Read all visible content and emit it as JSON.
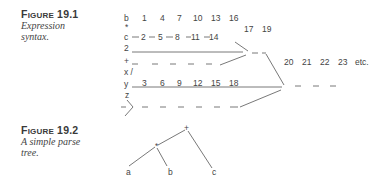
{
  "figures": [
    {
      "label_prefix": "F",
      "label_rest": "IGURE",
      "number": "19.1",
      "caption_line1": "Expression",
      "caption_line2": "syntax."
    },
    {
      "label_prefix": "F",
      "label_rest": "IGURE",
      "number": "19.2",
      "caption_line1": "A simple parse",
      "caption_line2": "tree."
    }
  ],
  "syntax_diagram": {
    "row_b": {
      "var": "b",
      "nums": [
        "1",
        "4",
        "7",
        "10",
        "13",
        "16"
      ]
    },
    "row_star": "*",
    "row_c": {
      "var": "c",
      "nums": [
        "2",
        "5",
        "8",
        "11",
        "14"
      ]
    },
    "row_2": "2",
    "row_plus": "+",
    "row_xslash": "x /",
    "row_y": {
      "var": "y",
      "nums": [
        "3",
        "6",
        "9",
        "12",
        "15",
        "18"
      ]
    },
    "row_z": "z",
    "mid_nums": [
      "17",
      "19"
    ],
    "right_nums": [
      "20",
      "21",
      "22",
      "23",
      "etc."
    ]
  },
  "parse_tree": {
    "root": "+",
    "inner": "*",
    "leaves": [
      "a",
      "b",
      "c"
    ]
  }
}
